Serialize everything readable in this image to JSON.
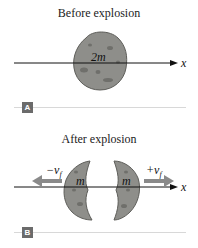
{
  "panel_a": {
    "title": "Before explosion",
    "mass_label": "2m",
    "axis_label": "x",
    "panel_label": "A"
  },
  "panel_b": {
    "title": "After explosion",
    "left_mass_label": "m",
    "right_mass_label": "m",
    "left_velocity_label": "−v",
    "left_velocity_subscript": "f",
    "right_velocity_label": "+v",
    "right_velocity_subscript": "f",
    "axis_label": "x",
    "panel_label": "B"
  },
  "colors": {
    "rock_fill": "#8e8e8a",
    "rock_stroke": "#5e5e5a",
    "arrow_gray": "#8a8a8a",
    "axis": "#111111",
    "label_box": "#6b6b6b",
    "divider": "#d8d8d8"
  }
}
